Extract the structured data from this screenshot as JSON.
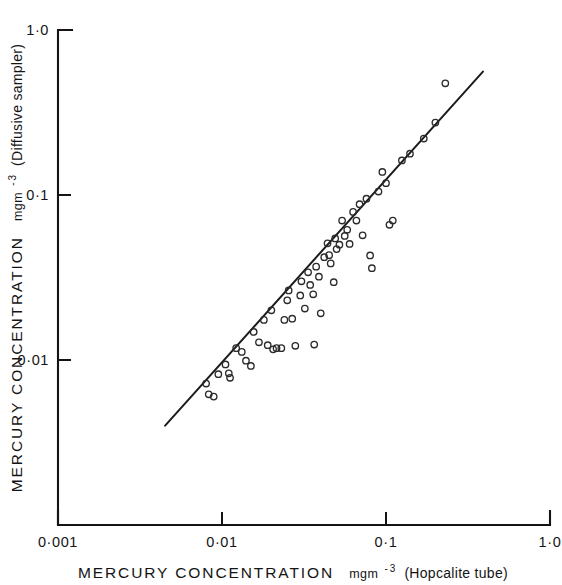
{
  "figure": {
    "background_color": "#ffffff",
    "ink_color": "#141414"
  },
  "chart_data": {
    "type": "scatter",
    "title": "",
    "subtitle": "",
    "xlabel": "MERCURY CONCENTRATION mgm-3 (Hopcalite tube)",
    "ylabel": "MERCURY CONCENTRATION mgm-3 (Diffusive sampler)",
    "xlabel_parts": {
      "main": "MERCURY   CONCENTRATION",
      "unit_base": "mgm",
      "unit_exp": "-3",
      "paren": "(Hopcalite tube)"
    },
    "ylabel_parts": {
      "main": "MERCURY  CONCENTRATION",
      "unit_base": "mgm",
      "unit_exp": "-3",
      "paren": "(Diffusive sampler)"
    },
    "xscale": "log",
    "yscale": "log",
    "xlim": [
      0.001,
      1.0
    ],
    "ylim": [
      0.001,
      1.0
    ],
    "grid": false,
    "legend": null,
    "xticks": [
      0.001,
      0.01,
      0.1,
      1.0
    ],
    "xticklabels": [
      "0·001",
      "0·01",
      "0·1",
      "1·0"
    ],
    "yticks": [
      0.01,
      0.1,
      1.0
    ],
    "yticklabels": [
      "0·01",
      "0·1",
      "1·0"
    ],
    "marker": "open-circle",
    "marker_size_px": 4.2,
    "fit_line": {
      "label": "regression line",
      "x_start": 0.0045,
      "y_start": 0.004,
      "x_end": 0.39,
      "y_end": 0.56
    },
    "n_points": 63,
    "points": [
      [
        0.008,
        0.0072
      ],
      [
        0.0083,
        0.0062
      ],
      [
        0.0089,
        0.006
      ],
      [
        0.0095,
        0.0082
      ],
      [
        0.0105,
        0.0094
      ],
      [
        0.011,
        0.0083
      ],
      [
        0.0112,
        0.0078
      ],
      [
        0.0122,
        0.0118
      ],
      [
        0.0132,
        0.0112
      ],
      [
        0.014,
        0.0099
      ],
      [
        0.015,
        0.0092
      ],
      [
        0.0156,
        0.0148
      ],
      [
        0.0168,
        0.0128
      ],
      [
        0.018,
        0.0175
      ],
      [
        0.019,
        0.0123
      ],
      [
        0.02,
        0.02
      ],
      [
        0.0205,
        0.0116
      ],
      [
        0.0215,
        0.0118
      ],
      [
        0.023,
        0.0118
      ],
      [
        0.024,
        0.0175
      ],
      [
        0.025,
        0.023
      ],
      [
        0.0255,
        0.0264
      ],
      [
        0.0268,
        0.0178
      ],
      [
        0.028,
        0.0122
      ],
      [
        0.03,
        0.0246
      ],
      [
        0.0305,
        0.03
      ],
      [
        0.032,
        0.0205
      ],
      [
        0.0335,
        0.034
      ],
      [
        0.0345,
        0.0285
      ],
      [
        0.036,
        0.025
      ],
      [
        0.0365,
        0.0124
      ],
      [
        0.0375,
        0.0368
      ],
      [
        0.039,
        0.032
      ],
      [
        0.04,
        0.0192
      ],
      [
        0.042,
        0.042
      ],
      [
        0.044,
        0.051
      ],
      [
        0.045,
        0.0432
      ],
      [
        0.046,
        0.0385
      ],
      [
        0.048,
        0.0296
      ],
      [
        0.049,
        0.0545
      ],
      [
        0.05,
        0.047
      ],
      [
        0.052,
        0.05
      ],
      [
        0.054,
        0.07
      ],
      [
        0.056,
        0.0565
      ],
      [
        0.058,
        0.0615
      ],
      [
        0.06,
        0.0505
      ],
      [
        0.063,
        0.079
      ],
      [
        0.066,
        0.07
      ],
      [
        0.069,
        0.088
      ],
      [
        0.072,
        0.057
      ],
      [
        0.076,
        0.095
      ],
      [
        0.08,
        0.043
      ],
      [
        0.082,
        0.036
      ],
      [
        0.09,
        0.105
      ],
      [
        0.095,
        0.138
      ],
      [
        0.1,
        0.118
      ],
      [
        0.105,
        0.066
      ],
      [
        0.11,
        0.07
      ],
      [
        0.125,
        0.162
      ],
      [
        0.14,
        0.178
      ],
      [
        0.17,
        0.22
      ],
      [
        0.2,
        0.275
      ],
      [
        0.23,
        0.475
      ]
    ]
  }
}
